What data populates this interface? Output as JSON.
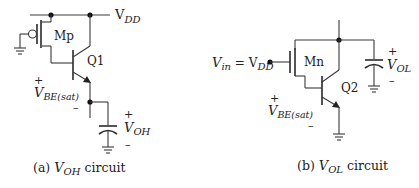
{
  "figure": {
    "panels": [
      {
        "id": "a",
        "caption_prefix": "(a) ",
        "caption_var": "V",
        "caption_sub": "OH",
        "caption_suffix": " circuit",
        "supply_label": "V",
        "supply_sub": "DD",
        "mosfet_label": "Mp",
        "bjt_label": "Q1",
        "vbe_plus": "+",
        "vbe_label": "V",
        "vbe_sub": "BE(sat)",
        "vbe_minus": "–",
        "out_plus": "+",
        "out_label": "V",
        "out_sub": "OH",
        "out_minus": "–"
      },
      {
        "id": "b",
        "caption_prefix": "(b) ",
        "caption_var": "V",
        "caption_sub": "OL",
        "caption_suffix": " circuit",
        "input_label": "V",
        "input_sub": "in",
        "input_eq": " = V",
        "input_eq_sub": "DD",
        "mosfet_label": "Mn",
        "bjt_label": "Q2",
        "vbe_plus": "+",
        "vbe_label": "V",
        "vbe_sub": "BE(sat)",
        "vbe_minus": "–",
        "out_plus": "+",
        "out_label": "V",
        "out_sub": "OL",
        "out_minus": "–"
      }
    ],
    "colors": {
      "wire": "#3a3a3a",
      "text": "#222222",
      "background": "#ffffff"
    }
  }
}
